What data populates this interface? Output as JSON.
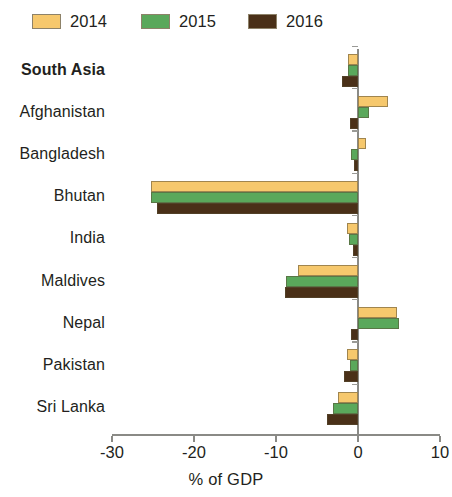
{
  "legend": {
    "items": [
      {
        "label": "2014",
        "color": "#f6c86d"
      },
      {
        "label": "2015",
        "color": "#5aa85b"
      },
      {
        "label": "2016",
        "color": "#4a3018"
      }
    ]
  },
  "axis": {
    "title": "% of GDP",
    "tick_labels": [
      "-30",
      "-20",
      "-10",
      "0",
      "10"
    ]
  },
  "chart_data": {
    "type": "bar",
    "orientation": "horizontal",
    "title": "",
    "subtitle": "",
    "xlabel": "% of GDP",
    "ylabel": "",
    "xlim": [
      -30,
      10
    ],
    "xticks": [
      -30,
      -20,
      -10,
      0,
      10
    ],
    "grid": false,
    "legend_position": "top-left",
    "categories": [
      "South Asia",
      "Afghanistan",
      "Bangladesh",
      "Bhutan",
      "India",
      "Maldives",
      "Nepal",
      "Pakistan",
      "Sri Lanka"
    ],
    "aggregate_categories": [
      "South Asia"
    ],
    "series": [
      {
        "name": "2014",
        "color": "#f6c86d",
        "values": [
          -1.2,
          3.6,
          1.0,
          -25.3,
          -1.3,
          -7.3,
          4.7,
          -1.3,
          -2.4
        ]
      },
      {
        "name": "2015",
        "color": "#5aa85b",
        "values": [
          -1.2,
          1.3,
          -0.8,
          -25.3,
          -1.1,
          -8.8,
          5.0,
          -1.0,
          -3.0
        ]
      },
      {
        "name": "2016",
        "color": "#4a3018",
        "values": [
          -2.0,
          -1.0,
          -0.5,
          -24.5,
          -0.6,
          -8.9,
          -0.8,
          -1.7,
          -3.8
        ]
      }
    ]
  }
}
